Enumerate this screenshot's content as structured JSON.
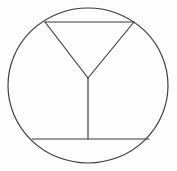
{
  "figure": {
    "background_color": "#fdfdfd",
    "stroke_color": "#3b3b3b",
    "stroke_width": "1.15",
    "canvas": {
      "width": 177,
      "height": 171
    },
    "shapes": [
      {
        "name": "outer-circle",
        "type": "ellipse",
        "cx": 88,
        "cy": 85.5,
        "rx": 80,
        "ry": 77.5
      },
      {
        "name": "top-chord",
        "type": "line",
        "x1": 45,
        "y1": 22,
        "x2": 134,
        "y2": 22
      },
      {
        "name": "triangle-left-leg",
        "type": "line",
        "x1": 45,
        "y1": 22,
        "x2": 88,
        "y2": 78
      },
      {
        "name": "triangle-right-leg",
        "type": "line",
        "x1": 134,
        "y1": 22,
        "x2": 88,
        "y2": 78
      },
      {
        "name": "vertical-stem",
        "type": "line",
        "x1": 88,
        "y1": 78,
        "x2": 88,
        "y2": 139
      },
      {
        "name": "bottom-chord",
        "type": "line",
        "x1": 32,
        "y1": 139,
        "x2": 149,
        "y2": 139
      }
    ]
  }
}
